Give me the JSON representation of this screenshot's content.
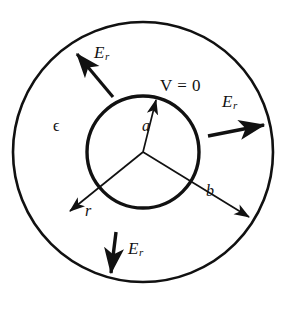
{
  "figure": {
    "background_color": "#ffffff",
    "stroke_color": "#111111",
    "labels": {
      "permittivity": "ϵ",
      "inner_radius": "a",
      "outer_radius": "b",
      "radial_coordinate": "r",
      "potential": "V = 0",
      "field_symbol": "E",
      "field_subscript": "r"
    },
    "geometry": {
      "center": {
        "x": 143,
        "y": 152
      },
      "outer_circle_radius": 130,
      "inner_circle_radius": 56,
      "outer_stroke_width": 2.6,
      "inner_stroke_width": 3.2,
      "radial_line_stroke_width": 1.7
    },
    "field_arrows": [
      {
        "name": "upper-left",
        "tail": {
          "x": 113,
          "y": 97
        },
        "head": {
          "x": 74,
          "y": 51
        },
        "label": "E_r"
      },
      {
        "name": "right",
        "tail": {
          "x": 208,
          "y": 135
        },
        "head": {
          "x": 267,
          "y": 124
        },
        "label": "E_r"
      },
      {
        "name": "bottom",
        "tail": {
          "x": 115,
          "y": 232
        },
        "head": {
          "x": 110,
          "y": 277
        },
        "label": "E_r"
      }
    ],
    "radial_lines": [
      {
        "name": "a-radius",
        "from": {
          "x": 143,
          "y": 152
        },
        "to": {
          "x": 155,
          "y": 98
        },
        "arrowhead": true,
        "label": "a"
      },
      {
        "name": "b-radius",
        "from": {
          "x": 143,
          "y": 152
        },
        "to": {
          "x": 251,
          "y": 219
        },
        "arrowhead": true,
        "label": "b"
      },
      {
        "name": "r-radius",
        "from": {
          "x": 143,
          "y": 152
        },
        "to": {
          "x": 68,
          "y": 212
        },
        "arrowhead": true,
        "label": "r"
      }
    ]
  }
}
